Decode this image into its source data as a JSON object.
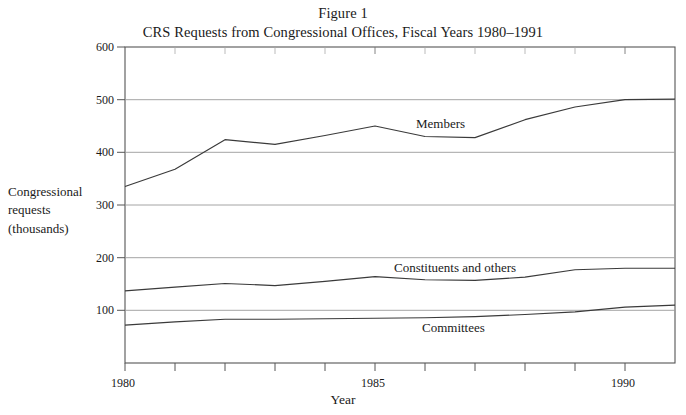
{
  "figure": {
    "title_line1": "Figure 1",
    "title_line2": "CRS Requests from Congressional Offices, Fiscal Years 1980–1991"
  },
  "axes": {
    "y_axis_title": "Congressional requests (thousands)",
    "y_axis_title_lines": [
      "Congressional",
      "requests",
      "(thousands)"
    ],
    "x_axis_title": "Year",
    "y_ticks": [
      "600",
      "500",
      "400",
      "300",
      "200",
      "100"
    ],
    "x_ticks_labeled": [
      "1980",
      "1985",
      "1990"
    ]
  },
  "series_labels": {
    "members": "Members",
    "constituents": "Constituents and others",
    "committees": "Committees"
  },
  "chart_data": {
    "type": "line",
    "title": "CRS Requests from Congressional Offices, Fiscal Years 1980–1991",
    "subtitle": "Figure 1",
    "xlabel": "Year",
    "ylabel": "Congressional requests (thousands)",
    "x": [
      1980,
      1981,
      1982,
      1983,
      1984,
      1985,
      1986,
      1987,
      1988,
      1989,
      1990,
      1991
    ],
    "xlim": [
      1980,
      1991
    ],
    "ylim": [
      0,
      600
    ],
    "y_tick_values": [
      100,
      200,
      300,
      400,
      500,
      600
    ],
    "x_tick_values": [
      1980,
      1981,
      1982,
      1983,
      1984,
      1985,
      1986,
      1987,
      1988,
      1989,
      1990,
      1991
    ],
    "grid": "horizontal",
    "legend": "inline-labels",
    "series": [
      {
        "name": "Members",
        "values": [
          335,
          368,
          424,
          415,
          432,
          450,
          430,
          428,
          462,
          486,
          500,
          501
        ]
      },
      {
        "name": "Constituents and others",
        "values": [
          137,
          144,
          151,
          147,
          155,
          164,
          158,
          157,
          163,
          177,
          180,
          180
        ]
      },
      {
        "name": "Committees",
        "values": [
          72,
          78,
          83,
          83,
          84,
          85,
          86,
          88,
          92,
          97,
          106,
          110
        ]
      }
    ]
  }
}
